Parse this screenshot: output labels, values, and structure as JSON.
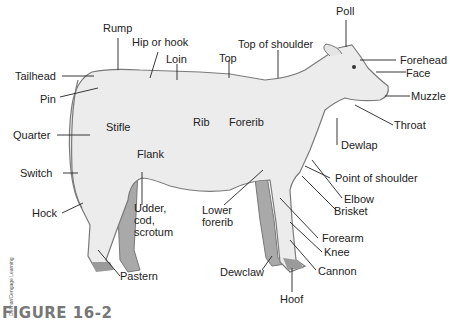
{
  "figure": {
    "caption": "FIGURE 16-2",
    "credit": "Delmar/Cengage Learning"
  },
  "labels": {
    "rump": "Rump",
    "hip": "Hip or hook",
    "loin": "Loin",
    "top": "Top",
    "top_shoulder": "Top of shoulder",
    "poll": "Poll",
    "forehead": "Forehead",
    "face": "Face",
    "muzzle": "Muzzle",
    "throat": "Throat",
    "dewlap": "Dewlap",
    "tailhead": "Tailhead",
    "pin": "Pin",
    "quarter": "Quarter",
    "stifle": "Stifle",
    "rib": "Rib",
    "forerib": "Forerib",
    "flank": "Flank",
    "switch": "Switch",
    "hock": "Hock",
    "udder": "Udder,\ncod,\nscrotum",
    "lower_forerib": "Lower\nforerib",
    "point_shoulder": "Point of shoulder",
    "elbow": "Elbow",
    "brisket": "Brisket",
    "forearm": "Forearm",
    "knee": "Knee",
    "cannon": "Cannon",
    "dewclaw": "Dewclaw",
    "hoof": "Hoof",
    "pastern": "Pastern"
  },
  "colors": {
    "body": "#ececec",
    "outline": "#7a7a7a",
    "far_legs": "#a9a9a9",
    "hoof": "#9a9a9a",
    "leader": "#222222"
  }
}
